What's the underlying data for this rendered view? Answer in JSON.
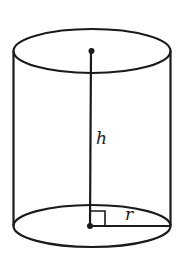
{
  "figure": {
    "type": "cylinder",
    "labels": {
      "height": "h",
      "radius": "r"
    },
    "colors": {
      "stroke": "#1a1a1a",
      "background": "#ffffff"
    }
  }
}
